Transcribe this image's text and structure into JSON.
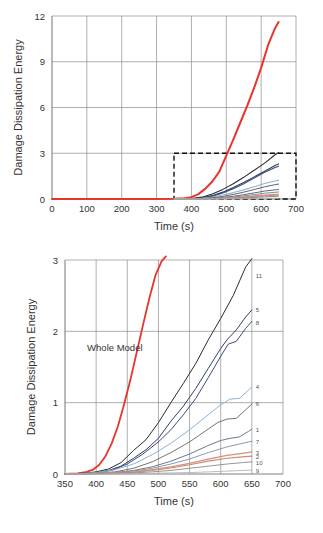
{
  "figure": {
    "panels": [
      "top-overview",
      "bottom-zoom"
    ]
  },
  "chart_data": [
    {
      "id": "top-overview",
      "type": "line",
      "title": "",
      "xlabel": "Time (s)",
      "ylabel": "Damage Dissipation Energy",
      "xlim": [
        0,
        700
      ],
      "ylim": [
        0,
        12
      ],
      "xticks": [
        0,
        100,
        200,
        300,
        400,
        500,
        600,
        700
      ],
      "yticks": [
        0,
        3,
        6,
        9,
        12
      ],
      "grid": true,
      "legend": "none",
      "annotations": [
        {
          "name": "inset-region-box",
          "x0": 350,
          "x1": 700,
          "y0": 0,
          "y1": 3,
          "style": "dashed-rectangle"
        }
      ],
      "series": [
        {
          "name": "Whole Model",
          "color": "#e8352c",
          "width": 2.0,
          "x": [
            0,
            100,
            200,
            300,
            350,
            380,
            400,
            420,
            440,
            460,
            480,
            500,
            520,
            540,
            560,
            580,
            600,
            620,
            640,
            650
          ],
          "y": [
            0,
            0,
            0,
            0,
            0.02,
            0.05,
            0.12,
            0.32,
            0.68,
            1.15,
            1.8,
            2.85,
            3.9,
            5.0,
            6.1,
            7.3,
            8.6,
            10.1,
            11.2,
            11.6
          ]
        },
        {
          "name": "11",
          "color": "#2b2b33",
          "width": 1.1,
          "x": [
            350,
            400,
            430,
            460,
            490,
            520,
            550,
            580,
            610,
            640,
            650
          ],
          "y": [
            0,
            0.03,
            0.12,
            0.33,
            0.63,
            1.0,
            1.42,
            1.88,
            2.35,
            2.9,
            3.05
          ]
        },
        {
          "name": "5",
          "color": "#2f3f63",
          "width": 1.1,
          "x": [
            350,
            400,
            430,
            460,
            490,
            520,
            550,
            580,
            610,
            640,
            650
          ],
          "y": [
            0,
            0.02,
            0.08,
            0.22,
            0.45,
            0.75,
            1.08,
            1.45,
            1.82,
            2.2,
            2.3
          ]
        },
        {
          "name": "8",
          "color": "#3b4a7a",
          "width": 1.1,
          "x": [
            350,
            400,
            430,
            460,
            490,
            520,
            550,
            580,
            610,
            640,
            650
          ],
          "y": [
            0,
            0.02,
            0.07,
            0.19,
            0.4,
            0.68,
            1.0,
            1.38,
            1.75,
            2.07,
            2.15
          ]
        },
        {
          "name": "4",
          "color": "#8cb4da",
          "width": 1.1,
          "x": [
            350,
            400,
            430,
            460,
            490,
            520,
            550,
            580,
            610,
            640,
            650
          ],
          "y": [
            0,
            0.01,
            0.05,
            0.13,
            0.26,
            0.42,
            0.6,
            0.8,
            1.02,
            1.18,
            1.22
          ]
        },
        {
          "name": "6",
          "color": "#6b6258",
          "width": 1.0,
          "x": [
            350,
            400,
            430,
            460,
            490,
            520,
            550,
            580,
            610,
            640,
            650
          ],
          "y": [
            0,
            0.01,
            0.03,
            0.08,
            0.17,
            0.3,
            0.45,
            0.62,
            0.8,
            0.94,
            0.98
          ]
        },
        {
          "name": "1",
          "color": "#5a6b80",
          "width": 1.0,
          "x": [
            350,
            400,
            430,
            460,
            490,
            520,
            550,
            580,
            610,
            640,
            650
          ],
          "y": [
            0,
            0.0,
            0.02,
            0.05,
            0.1,
            0.18,
            0.28,
            0.4,
            0.52,
            0.6,
            0.62
          ]
        },
        {
          "name": "7",
          "color": "#7d8ea3",
          "width": 1.0,
          "x": [
            350,
            400,
            430,
            460,
            490,
            520,
            550,
            580,
            610,
            640,
            650
          ],
          "y": [
            0,
            0.0,
            0.01,
            0.03,
            0.07,
            0.13,
            0.2,
            0.29,
            0.38,
            0.44,
            0.46
          ]
        },
        {
          "name": "3",
          "color": "#d98f7a",
          "width": 1.2,
          "x": [
            350,
            400,
            430,
            460,
            490,
            520,
            550,
            580,
            610,
            640,
            650
          ],
          "y": [
            0,
            0.0,
            0.01,
            0.02,
            0.05,
            0.09,
            0.14,
            0.2,
            0.26,
            0.3,
            0.31
          ]
        },
        {
          "name": "2",
          "color": "#c98b74",
          "width": 1.0,
          "x": [
            350,
            400,
            430,
            460,
            490,
            520,
            550,
            580,
            610,
            640,
            650
          ],
          "y": [
            0,
            0.0,
            0.01,
            0.02,
            0.04,
            0.07,
            0.11,
            0.16,
            0.21,
            0.25,
            0.26
          ]
        },
        {
          "name": "10",
          "color": "#8a8a8a",
          "width": 1.0,
          "x": [
            350,
            400,
            430,
            460,
            490,
            520,
            550,
            580,
            610,
            640,
            650
          ],
          "y": [
            0,
            0.0,
            0.0,
            0.01,
            0.02,
            0.04,
            0.07,
            0.1,
            0.14,
            0.17,
            0.18
          ]
        },
        {
          "name": "9",
          "color": "#b0b6bd",
          "width": 1.0,
          "x": [
            350,
            400,
            430,
            460,
            490,
            520,
            550,
            580,
            610,
            640,
            650
          ],
          "y": [
            0,
            0.0,
            0.0,
            0.0,
            0.01,
            0.01,
            0.02,
            0.03,
            0.04,
            0.05,
            0.05
          ]
        }
      ]
    },
    {
      "id": "bottom-zoom",
      "type": "line",
      "title": "",
      "xlabel": "Time (s)",
      "ylabel": "Damage Dissipation Energy",
      "xlim": [
        350,
        700
      ],
      "ylim": [
        0,
        3
      ],
      "xticks": [
        350,
        400,
        450,
        500,
        550,
        600,
        650,
        700
      ],
      "yticks": [
        0,
        1,
        2,
        3
      ],
      "grid": true,
      "legend": "curve-end-labels",
      "annotations": [
        {
          "name": "whole-model-label",
          "text": "Whole Model",
          "x": 430,
          "y": 1.72
        }
      ],
      "end_labels": [
        {
          "label": "11",
          "x": 650,
          "y": 2.78
        },
        {
          "label": "5",
          "x": 650,
          "y": 2.3
        },
        {
          "label": "8",
          "x": 650,
          "y": 2.12
        },
        {
          "label": "4",
          "x": 650,
          "y": 1.22
        },
        {
          "label": "6",
          "x": 650,
          "y": 0.98
        },
        {
          "label": "1",
          "x": 650,
          "y": 0.62
        },
        {
          "label": "7",
          "x": 650,
          "y": 0.45
        },
        {
          "label": "3",
          "x": 650,
          "y": 0.3
        },
        {
          "label": "2",
          "x": 650,
          "y": 0.24
        },
        {
          "label": "10",
          "x": 650,
          "y": 0.16
        },
        {
          "label": "9",
          "x": 650,
          "y": 0.05
        }
      ],
      "series": [
        {
          "name": "Whole Model",
          "color": "#e8352c",
          "width": 1.8,
          "x": [
            350,
            370,
            385,
            395,
            405,
            415,
            425,
            435,
            445,
            455,
            465,
            475,
            485,
            495,
            505,
            512
          ],
          "y": [
            0,
            0.01,
            0.03,
            0.06,
            0.13,
            0.25,
            0.43,
            0.67,
            0.98,
            1.32,
            1.7,
            2.08,
            2.45,
            2.78,
            2.98,
            3.05
          ]
        },
        {
          "name": "11",
          "color": "#2b2b33",
          "width": 1.0,
          "x": [
            350,
            380,
            400,
            420,
            440,
            460,
            480,
            500,
            520,
            540,
            560,
            580,
            600,
            620,
            640,
            650
          ],
          "y": [
            0,
            0.01,
            0.03,
            0.07,
            0.16,
            0.33,
            0.48,
            0.72,
            1.0,
            1.27,
            1.55,
            1.88,
            2.18,
            2.5,
            2.9,
            3.02
          ]
        },
        {
          "name": "5",
          "color": "#2f3f63",
          "width": 1.0,
          "x": [
            350,
            380,
            400,
            420,
            440,
            460,
            480,
            500,
            520,
            540,
            560,
            580,
            600,
            610,
            625,
            640,
            650
          ],
          "y": [
            0,
            0.01,
            0.02,
            0.05,
            0.11,
            0.22,
            0.34,
            0.5,
            0.74,
            0.95,
            1.2,
            1.48,
            1.76,
            1.88,
            2.02,
            2.2,
            2.3
          ]
        },
        {
          "name": "8",
          "color": "#3b4a7a",
          "width": 1.0,
          "x": [
            350,
            380,
            400,
            425,
            450,
            475,
            500,
            520,
            540,
            560,
            580,
            600,
            612,
            625,
            640,
            650
          ],
          "y": [
            0,
            0.01,
            0.02,
            0.05,
            0.14,
            0.28,
            0.45,
            0.62,
            0.83,
            1.06,
            1.35,
            1.65,
            1.82,
            1.86,
            2.04,
            2.14
          ]
        },
        {
          "name": "4",
          "color": "#8cb4da",
          "width": 1.0,
          "x": [
            350,
            380,
            400,
            430,
            460,
            490,
            520,
            550,
            580,
            600,
            615,
            630,
            645,
            650
          ],
          "y": [
            0,
            0.01,
            0.02,
            0.06,
            0.14,
            0.27,
            0.43,
            0.62,
            0.83,
            0.97,
            1.05,
            1.06,
            1.18,
            1.22
          ]
        },
        {
          "name": "6",
          "color": "#6b6258",
          "width": 0.9,
          "x": [
            350,
            380,
            400,
            430,
            460,
            490,
            520,
            550,
            575,
            595,
            610,
            625,
            640,
            650
          ],
          "y": [
            0,
            0.0,
            0.01,
            0.03,
            0.08,
            0.17,
            0.3,
            0.45,
            0.6,
            0.72,
            0.77,
            0.78,
            0.9,
            0.98
          ]
        },
        {
          "name": "1",
          "color": "#5a6b80",
          "width": 0.9,
          "x": [
            350,
            380,
            400,
            430,
            460,
            490,
            520,
            550,
            580,
            600,
            615,
            630,
            645,
            650
          ],
          "y": [
            0,
            0.0,
            0.01,
            0.02,
            0.05,
            0.1,
            0.18,
            0.28,
            0.4,
            0.47,
            0.5,
            0.52,
            0.6,
            0.63
          ]
        },
        {
          "name": "7",
          "color": "#7d8ea3",
          "width": 0.9,
          "x": [
            350,
            380,
            400,
            430,
            460,
            490,
            520,
            550,
            580,
            610,
            635,
            650
          ],
          "y": [
            0,
            0.0,
            0.01,
            0.02,
            0.04,
            0.08,
            0.14,
            0.21,
            0.3,
            0.38,
            0.43,
            0.46
          ]
        },
        {
          "name": "3",
          "color": "#d98f7a",
          "width": 1.3,
          "x": [
            350,
            380,
            400,
            430,
            460,
            490,
            520,
            550,
            580,
            610,
            635,
            650
          ],
          "y": [
            0,
            0.0,
            0.01,
            0.02,
            0.03,
            0.06,
            0.1,
            0.15,
            0.21,
            0.26,
            0.29,
            0.31
          ]
        },
        {
          "name": "2",
          "color": "#c98b74",
          "width": 1.1,
          "x": [
            350,
            380,
            400,
            430,
            460,
            490,
            520,
            550,
            580,
            610,
            635,
            650
          ],
          "y": [
            0,
            0.0,
            0.01,
            0.015,
            0.025,
            0.05,
            0.085,
            0.13,
            0.18,
            0.22,
            0.24,
            0.25
          ]
        },
        {
          "name": "10",
          "color": "#8a8a8a",
          "width": 0.9,
          "x": [
            350,
            380,
            400,
            430,
            460,
            490,
            520,
            550,
            580,
            610,
            635,
            650
          ],
          "y": [
            0,
            0.0,
            0.0,
            0.01,
            0.015,
            0.03,
            0.05,
            0.08,
            0.11,
            0.14,
            0.16,
            0.17
          ]
        },
        {
          "name": "9",
          "color": "#b0b6bd",
          "width": 0.9,
          "x": [
            350,
            380,
            400,
            430,
            460,
            490,
            520,
            550,
            580,
            610,
            635,
            650
          ],
          "y": [
            0,
            0.0,
            0.0,
            0.0,
            0.005,
            0.01,
            0.015,
            0.02,
            0.03,
            0.04,
            0.05,
            0.055
          ]
        }
      ]
    }
  ]
}
